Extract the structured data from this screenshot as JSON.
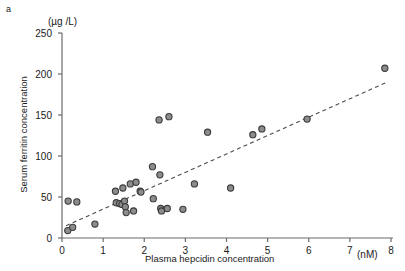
{
  "panel": {
    "label": "a"
  },
  "axes": {
    "y_unit": "(µg /L)",
    "x_unit": "(nM)",
    "y_title": "Serum ferritin concentration",
    "x_title": "Plasma hepcidin concentration"
  },
  "chart_data": {
    "type": "scatter",
    "title": "",
    "xlabel": "Plasma hepcidin concentration",
    "ylabel": "Serum ferritin concentration",
    "x_unit": "(nM)",
    "y_unit": "(µg /L)",
    "xlim": [
      0,
      8
    ],
    "ylim": [
      0,
      250
    ],
    "xticks": [
      0,
      1,
      2,
      3,
      4,
      5,
      6,
      7,
      8
    ],
    "yticks": [
      0,
      50,
      100,
      150,
      200,
      250
    ],
    "grid": false,
    "legend": null,
    "marker": {
      "shape": "circle",
      "fill": "#8c8c8c",
      "stroke": "#3a3a3a",
      "radius_px": 3.1
    },
    "points": [
      {
        "x": 0.15,
        "y": 45
      },
      {
        "x": 0.36,
        "y": 44
      },
      {
        "x": 0.14,
        "y": 9
      },
      {
        "x": 0.26,
        "y": 13
      },
      {
        "x": 0.8,
        "y": 17
      },
      {
        "x": 1.3,
        "y": 57
      },
      {
        "x": 1.32,
        "y": 43
      },
      {
        "x": 1.4,
        "y": 42
      },
      {
        "x": 1.46,
        "y": 41
      },
      {
        "x": 1.48,
        "y": 61
      },
      {
        "x": 1.52,
        "y": 45
      },
      {
        "x": 1.54,
        "y": 38
      },
      {
        "x": 1.56,
        "y": 31
      },
      {
        "x": 1.66,
        "y": 66
      },
      {
        "x": 1.74,
        "y": 33
      },
      {
        "x": 1.8,
        "y": 68
      },
      {
        "x": 1.9,
        "y": 57
      },
      {
        "x": 1.92,
        "y": 56
      },
      {
        "x": 2.2,
        "y": 87
      },
      {
        "x": 2.22,
        "y": 48
      },
      {
        "x": 2.38,
        "y": 77
      },
      {
        "x": 2.4,
        "y": 36
      },
      {
        "x": 2.42,
        "y": 33
      },
      {
        "x": 2.56,
        "y": 36
      },
      {
        "x": 2.94,
        "y": 35
      },
      {
        "x": 3.22,
        "y": 66
      },
      {
        "x": 2.36,
        "y": 144
      },
      {
        "x": 2.6,
        "y": 148
      },
      {
        "x": 3.54,
        "y": 129
      },
      {
        "x": 4.1,
        "y": 61
      },
      {
        "x": 4.64,
        "y": 126
      },
      {
        "x": 4.86,
        "y": 133
      },
      {
        "x": 5.96,
        "y": 145
      },
      {
        "x": 7.85,
        "y": 207
      }
    ],
    "trendline": {
      "style": "dashed",
      "color": "#4d4d4d",
      "x_start": 0.1,
      "y_start": 15,
      "x_end": 7.9,
      "y_end": 190
    }
  }
}
